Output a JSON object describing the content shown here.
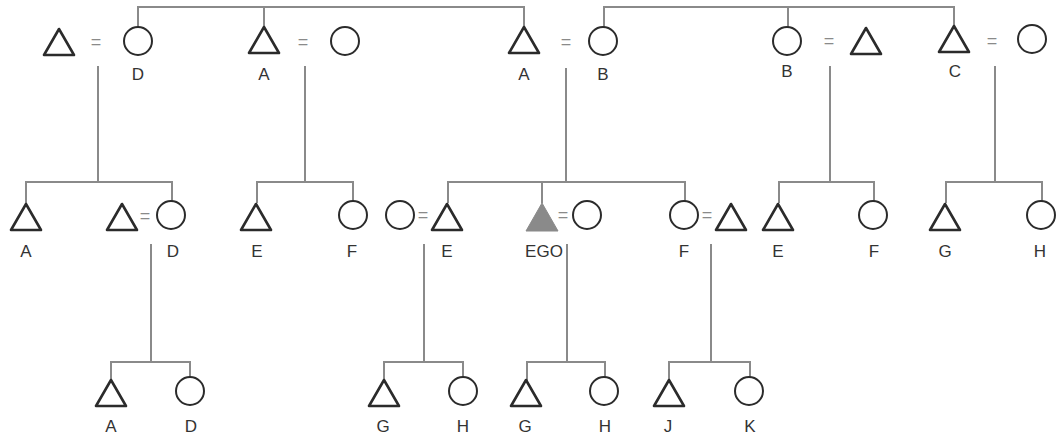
{
  "diagram": {
    "type": "kinship-chart",
    "symbols": {
      "male": "triangle",
      "female": "circle",
      "marriage": "=",
      "ego_marker": "filled-triangle"
    },
    "colors": {
      "stroke": "#2b2b2b",
      "lines": "#8a8a8a",
      "ego_fill": "#8a8a8a"
    },
    "equals_sign": "=",
    "generation_1": {
      "couples": [
        {
          "husband_label": "",
          "wife_label": "D"
        },
        {
          "husband_label": "A",
          "wife_label": ""
        },
        {
          "husband_label": "A",
          "wife_label": "B"
        },
        {
          "wife_label": "B",
          "husband_label": ""
        },
        {
          "husband_label": "C",
          "wife_label": ""
        }
      ]
    },
    "generation_2": {
      "family_1": {
        "son_label": "A",
        "son2_label": "",
        "wife_label": "D"
      },
      "family_2": {
        "son_label": "E",
        "daughter_label": "F"
      },
      "family_3": {
        "e_wife_label": "",
        "e_label": "E",
        "ego_label": "EGO",
        "ego_wife_label": "",
        "f_label": "F",
        "f_husband_label": ""
      },
      "family_4": {
        "son_label": "E",
        "daughter_label": "F"
      },
      "family_5": {
        "son_label": "G",
        "daughter_label": "H"
      }
    },
    "generation_3": {
      "family_1": {
        "son_label": "A",
        "daughter_label": "D"
      },
      "family_2": {
        "son_label": "G",
        "daughter_label": "H"
      },
      "family_3": {
        "son_label": "G",
        "daughter_label": "H"
      },
      "family_4": {
        "son_label": "J",
        "daughter_label": "K"
      }
    }
  }
}
